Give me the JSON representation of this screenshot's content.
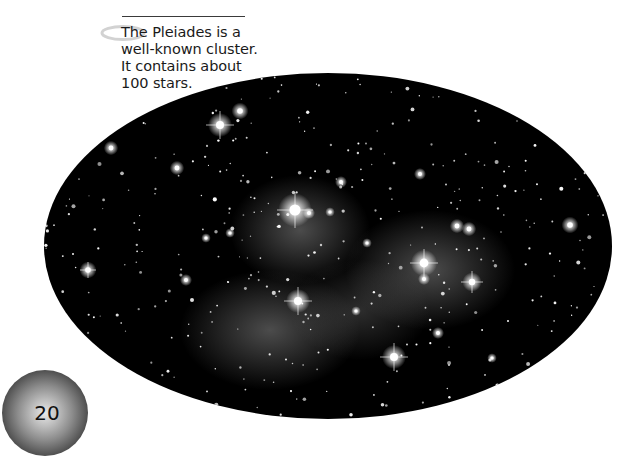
{
  "caption": {
    "lines": [
      "The Pleiades is a",
      "well-known cluster.",
      "It contains about",
      "100 stars."
    ]
  },
  "page": {
    "number": "20"
  },
  "photo": {
    "subject": "Pleiades star cluster",
    "background_color": "#000000",
    "nebula_color": "#9a9a9a",
    "ellipse": {
      "cx": 328,
      "cy": 246,
      "rx": 284,
      "ry": 173
    }
  },
  "icons": {
    "ring": "saturn-ring-icon",
    "badge": "galaxy-badge-icon"
  }
}
